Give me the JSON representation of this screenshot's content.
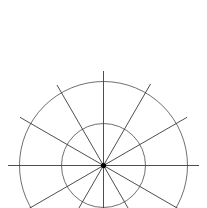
{
  "diagram": {
    "type": "polar-grid",
    "center": {
      "x": 103.5,
      "y": 165.5
    },
    "circles": [
      {
        "name": "inner-circle",
        "r": 42
      },
      {
        "name": "outer-circle",
        "r": 84
      }
    ],
    "spoke_count": 12,
    "spoke_angle_step_deg": 30,
    "colors": {
      "background": "#ffffff",
      "line": "#3a3a3a",
      "circle": "#4a4a4a",
      "center_dot": "#000000"
    }
  }
}
